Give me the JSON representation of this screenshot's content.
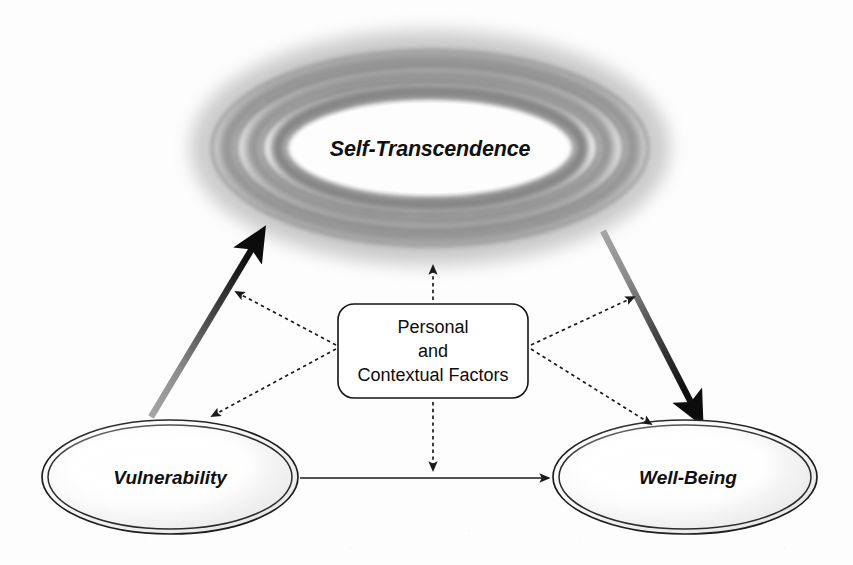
{
  "diagram": {
    "background_color": "#fdfdfd",
    "width": 853,
    "height": 565,
    "nodes": {
      "self_transcendence": {
        "label": "Self-Transcendence",
        "shape": "concentric-ring-ellipse",
        "cx": 430,
        "cy": 148,
        "rx": 220,
        "ry": 98,
        "text_color": "#101010",
        "ring_color": "#7d7d7d"
      },
      "vulnerability": {
        "label": "Vulnerability",
        "shape": "double-ellipse",
        "cx": 170,
        "cy": 477,
        "rx": 128,
        "ry": 57,
        "text_color": "#101010",
        "stroke_color": "#1e1e1e"
      },
      "well_being": {
        "label": "Well-Being",
        "shape": "double-ellipse",
        "cx": 685,
        "cy": 477,
        "rx": 132,
        "ry": 57,
        "text_color": "#101010",
        "stroke_color": "#1e1e1e"
      },
      "factors_box": {
        "shape": "rounded-rectangle",
        "lines": [
          "Personal",
          "and",
          "Contextual Factors"
        ],
        "x": 338,
        "y": 304,
        "width": 190,
        "height": 94,
        "text_color": "#0d0d0d",
        "stroke_color": "#141414",
        "fill_color": "#ffffff"
      }
    },
    "edges": [
      {
        "name": "vulnerability-to-self-transcendence",
        "style": "solid-thick-gradient",
        "from": "vulnerability",
        "to": "self_transcendence",
        "direction": "up-right",
        "gradient_from": "#9a9a9a",
        "gradient_to": "#111111"
      },
      {
        "name": "self-transcendence-to-well-being",
        "style": "solid-thick-gradient",
        "from": "self_transcendence",
        "to": "well_being",
        "direction": "down-right",
        "gradient_from": "#9a9a9a",
        "gradient_to": "#111111"
      },
      {
        "name": "vulnerability-to-well-being",
        "style": "solid-thin",
        "from": "vulnerability",
        "to": "well_being",
        "direction": "right",
        "color": "#1a1a1a"
      },
      {
        "name": "factors-to-self-transcendence",
        "style": "dashed",
        "from": "factors_box",
        "to": "self_transcendence",
        "direction": "up",
        "color": "#1a1a1a"
      },
      {
        "name": "factors-to-vulnerability-path",
        "style": "dashed",
        "from": "factors_box",
        "to": "vulnerability-to-self-transcendence",
        "direction": "up-left",
        "color": "#1a1a1a"
      },
      {
        "name": "factors-to-vulnerability",
        "style": "dashed",
        "from": "factors_box",
        "to": "vulnerability",
        "direction": "down-left",
        "color": "#1a1a1a"
      },
      {
        "name": "factors-to-well-being-path",
        "style": "dashed",
        "from": "factors_box",
        "to": "self-transcendence-to-well-being",
        "direction": "up-right",
        "color": "#1a1a1a"
      },
      {
        "name": "factors-to-well-being",
        "style": "dashed",
        "from": "factors_box",
        "to": "well_being",
        "direction": "down-right",
        "color": "#1a1a1a"
      },
      {
        "name": "factors-to-vulnerability-well-being-path",
        "style": "dashed",
        "from": "factors_box",
        "to": "vulnerability-to-well-being",
        "direction": "down",
        "color": "#1a1a1a"
      }
    ]
  }
}
